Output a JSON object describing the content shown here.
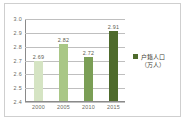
{
  "chart_data": {
    "type": "bar",
    "title": "",
    "subtitle": "",
    "xlabel": "",
    "ylabel": "",
    "categories": [
      "2000",
      "2005",
      "2010",
      "2015"
    ],
    "values": [
      2.69,
      2.82,
      2.72,
      2.91
    ],
    "value_labels": [
      "2.69",
      "2.82",
      "2.72",
      "2.91"
    ],
    "series": [
      {
        "name": "户籍人口（万人）",
        "values": [
          2.69,
          2.82,
          2.72,
          2.91
        ]
      }
    ],
    "ylim": [
      2.4,
      3.0
    ],
    "y_ticks": [
      3.0,
      2.9,
      2.8,
      2.7,
      2.6,
      2.5,
      2.4
    ],
    "y_tick_labels": [
      "3.0",
      "2.9",
      "2.8",
      "2.7",
      "2.6",
      "2.5",
      "2.4"
    ],
    "grid": true,
    "grid_axis": "y",
    "legend_position": "right",
    "bar_colors": [
      "#d5e4c3",
      "#a9c786",
      "#7a9e55",
      "#4e6b2c"
    ],
    "annotations": []
  },
  "legend": {
    "label_line_1": "户籍人口",
    "label_line_2": "（万人）",
    "swatch_color": "#4e6b2c"
  },
  "colors": {
    "frame_border": "#cfcfcf",
    "plot_background": "#ffffff",
    "grid_line": "#bfbfbf",
    "axis_line": "#8a8a8a",
    "tick_text": "#6b6b5f",
    "value_text": "#5d5d50"
  }
}
